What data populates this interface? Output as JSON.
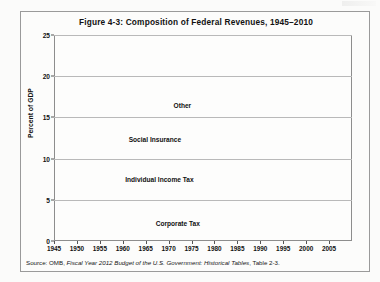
{
  "figure": {
    "title": "Figure 4-3: Composition of Federal Revenues, 1945–2010",
    "source": "Source: OMB, ",
    "source_italic": "Fiscal Year 2012 Budget of the U.S. Government: Historical Tables",
    "source_tail": ", Table 2-3."
  },
  "chart_data": {
    "type": "line",
    "title": "Figure 4-3: Composition of Federal Revenues, 1945–2010",
    "xlabel": "",
    "ylabel": "Percent of GDP",
    "xlim": [
      1945,
      2010
    ],
    "ylim": [
      0,
      25
    ],
    "yticks": [
      0,
      5,
      10,
      15,
      20,
      25
    ],
    "xticks": [
      1945,
      1950,
      1955,
      1960,
      1965,
      1970,
      1975,
      1980,
      1985,
      1990,
      1995,
      2000,
      2005
    ],
    "grid": "horizontal",
    "legend": "inline-labels",
    "note": "Cumulative stacked boundaries: each line is the running total of revenue sources as a percent of GDP.",
    "x": [
      1945,
      1946,
      1947,
      1948,
      1949,
      1950,
      1951,
      1952,
      1953,
      1954,
      1955,
      1956,
      1957,
      1958,
      1959,
      1960,
      1961,
      1962,
      1963,
      1964,
      1965,
      1966,
      1967,
      1968,
      1969,
      1970,
      1971,
      1972,
      1973,
      1974,
      1975,
      1976,
      1977,
      1978,
      1979,
      1980,
      1981,
      1982,
      1983,
      1984,
      1985,
      1986,
      1987,
      1988,
      1989,
      1990,
      1991,
      1992,
      1993,
      1994,
      1995,
      1996,
      1997,
      1998,
      1999,
      2000,
      2001,
      2002,
      2003,
      2004,
      2005,
      2006,
      2007,
      2008,
      2009,
      2010
    ],
    "series": [
      {
        "name": "Corporate Tax",
        "label": "Corporate Tax",
        "label_x": 1972,
        "label_y": 2.1,
        "values": [
          7.1,
          5.3,
          3.8,
          3.8,
          4.1,
          3.8,
          4.4,
          5.9,
          5.6,
          5.6,
          4.5,
          4.9,
          4.7,
          4.3,
          3.5,
          4.1,
          4.0,
          3.6,
          3.6,
          3.6,
          3.7,
          4.0,
          4.2,
          3.3,
          3.9,
          3.2,
          2.5,
          2.7,
          2.8,
          2.7,
          2.6,
          2.4,
          2.8,
          2.7,
          2.6,
          2.4,
          2.0,
          1.5,
          1.1,
          1.5,
          1.5,
          1.4,
          1.8,
          1.9,
          1.9,
          1.6,
          1.7,
          1.6,
          1.8,
          2.0,
          2.1,
          2.2,
          2.2,
          2.2,
          2.0,
          2.1,
          1.5,
          1.4,
          1.2,
          1.6,
          2.2,
          2.7,
          2.7,
          2.1,
          1.0,
          1.3
        ]
      },
      {
        "name": "Individual Income Tax (cumulative)",
        "label": "Individual Income Tax",
        "label_x": 1968,
        "label_y": 7.4,
        "values": [
          15.5,
          12.9,
          11.4,
          11.3,
          10.0,
          9.6,
          12.1,
          14.1,
          13.6,
          13.3,
          11.9,
          12.6,
          12.7,
          11.8,
          10.9,
          12.1,
          12.0,
          11.6,
          11.7,
          11.0,
          10.8,
          11.4,
          11.9,
          11.7,
          13.4,
          12.2,
          10.8,
          11.1,
          11.3,
          11.3,
          10.9,
          10.7,
          11.3,
          11.4,
          11.8,
          11.8,
          11.7,
          10.9,
          9.8,
          9.4,
          9.7,
          9.3,
          10.2,
          10.1,
          10.2,
          9.8,
          9.5,
          9.4,
          9.6,
          9.7,
          10.0,
          10.4,
          10.8,
          11.3,
          11.4,
          12.1,
          11.3,
          9.8,
          8.9,
          8.5,
          9.4,
          10.1,
          10.8,
          9.9,
          7.4,
          7.9
        ]
      },
      {
        "name": "Social Insurance (cumulative)",
        "label": "Social Insurance",
        "label_x": 1967,
        "label_y": 12.2,
        "values": [
          17.1,
          14.4,
          12.9,
          12.8,
          11.3,
          11.2,
          13.9,
          15.8,
          15.3,
          15.1,
          13.8,
          14.7,
          14.9,
          14.0,
          13.1,
          14.5,
          14.5,
          14.1,
          14.6,
          13.7,
          13.5,
          14.7,
          15.5,
          15.7,
          17.3,
          16.2,
          14.9,
          15.2,
          16.0,
          16.2,
          15.5,
          15.5,
          16.2,
          16.4,
          16.8,
          17.0,
          17.4,
          16.6,
          15.4,
          15.3,
          15.7,
          15.4,
          16.2,
          16.3,
          16.4,
          16.0,
          15.7,
          15.7,
          15.9,
          16.3,
          16.5,
          16.9,
          17.1,
          17.6,
          17.7,
          18.2,
          17.5,
          16.0,
          15.0,
          14.6,
          15.5,
          16.1,
          16.7,
          15.6,
          13.3,
          13.6
        ]
      },
      {
        "name": "Other (total revenues)",
        "label": "Other",
        "label_x": 1973,
        "label_y": 16.4,
        "values": [
          20.4,
          17.7,
          16.5,
          16.2,
          14.5,
          14.4,
          16.1,
          19.0,
          18.7,
          18.5,
          16.5,
          17.5,
          17.7,
          16.8,
          16.2,
          17.8,
          17.8,
          17.6,
          17.8,
          17.6,
          17.0,
          17.3,
          18.4,
          17.6,
          19.7,
          19.0,
          17.3,
          17.6,
          17.6,
          18.3,
          17.9,
          17.1,
          18.0,
          18.0,
          18.5,
          19.0,
          19.6,
          19.2,
          17.5,
          17.3,
          17.7,
          17.5,
          18.4,
          18.2,
          18.4,
          18.0,
          17.8,
          17.5,
          17.5,
          18.0,
          18.4,
          18.8,
          19.2,
          19.9,
          19.8,
          20.6,
          19.5,
          17.6,
          16.2,
          16.1,
          17.3,
          18.2,
          18.5,
          17.6,
          15.1,
          15.1
        ]
      }
    ]
  }
}
